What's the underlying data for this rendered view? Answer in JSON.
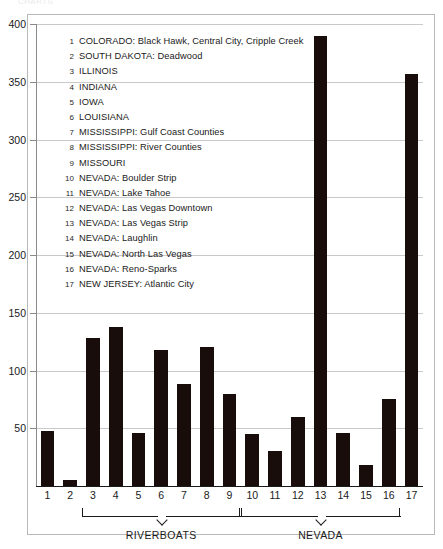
{
  "figure": {
    "clipped_header": "CHARTS",
    "background": "#ffffff",
    "bar_color": "#190d0b",
    "grid_color": "#c9c9c9",
    "axis_color": "#1a1a1a"
  },
  "legend": {
    "items": [
      {
        "num": "1",
        "label": "COLORADO: Black Hawk, Central City, Cripple Creek"
      },
      {
        "num": "2",
        "label": "SOUTH DAKOTA: Deadwood"
      },
      {
        "num": "3",
        "label": "ILLINOIS"
      },
      {
        "num": "4",
        "label": "INDIANA"
      },
      {
        "num": "5",
        "label": "IOWA"
      },
      {
        "num": "6",
        "label": "LOUISIANA"
      },
      {
        "num": "7",
        "label": "MISSISSIPPI: Gulf Coast Counties"
      },
      {
        "num": "8",
        "label": "MISSISSIPPI: River Counties"
      },
      {
        "num": "9",
        "label": "MISSOURI"
      },
      {
        "num": "10",
        "label": "NEVADA: Boulder Strip"
      },
      {
        "num": "11",
        "label": "NEVADA: Lake Tahoe"
      },
      {
        "num": "12",
        "label": "NEVADA: Las Vegas Downtown"
      },
      {
        "num": "13",
        "label": "NEVADA: Las Vegas Strip"
      },
      {
        "num": "14",
        "label": "NEVADA: Laughlin"
      },
      {
        "num": "15",
        "label": "NEVADA: North Las Vegas"
      },
      {
        "num": "16",
        "label": "NEVADA: Reno-Sparks"
      },
      {
        "num": "17",
        "label": "NEW JERSEY: Atlantic City"
      }
    ]
  },
  "groups": [
    {
      "name": "riverboats-bracket",
      "label": "RIVERBOATS",
      "from": 3,
      "to": 9
    },
    {
      "name": "nevada-bracket",
      "label": "NEVADA",
      "from": 10,
      "to": 16
    }
  ],
  "chart_data": {
    "type": "bar",
    "title": "",
    "xlabel": "",
    "ylabel": "",
    "ylim": [
      0,
      400
    ],
    "yticks": [
      50,
      100,
      150,
      200,
      250,
      300,
      350,
      400
    ],
    "ytick_labels": [
      "50",
      "100",
      "150",
      "200",
      "250",
      "300",
      "350",
      "400"
    ],
    "grid": true,
    "legend_position": "inside-upper-left",
    "categories": [
      "1",
      "2",
      "3",
      "4",
      "5",
      "6",
      "7",
      "8",
      "9",
      "10",
      "11",
      "12",
      "13",
      "14",
      "15",
      "16",
      "17"
    ],
    "values": [
      48,
      5,
      128,
      138,
      46,
      118,
      88,
      120,
      80,
      45,
      30,
      60,
      390,
      46,
      18,
      75,
      357
    ]
  }
}
